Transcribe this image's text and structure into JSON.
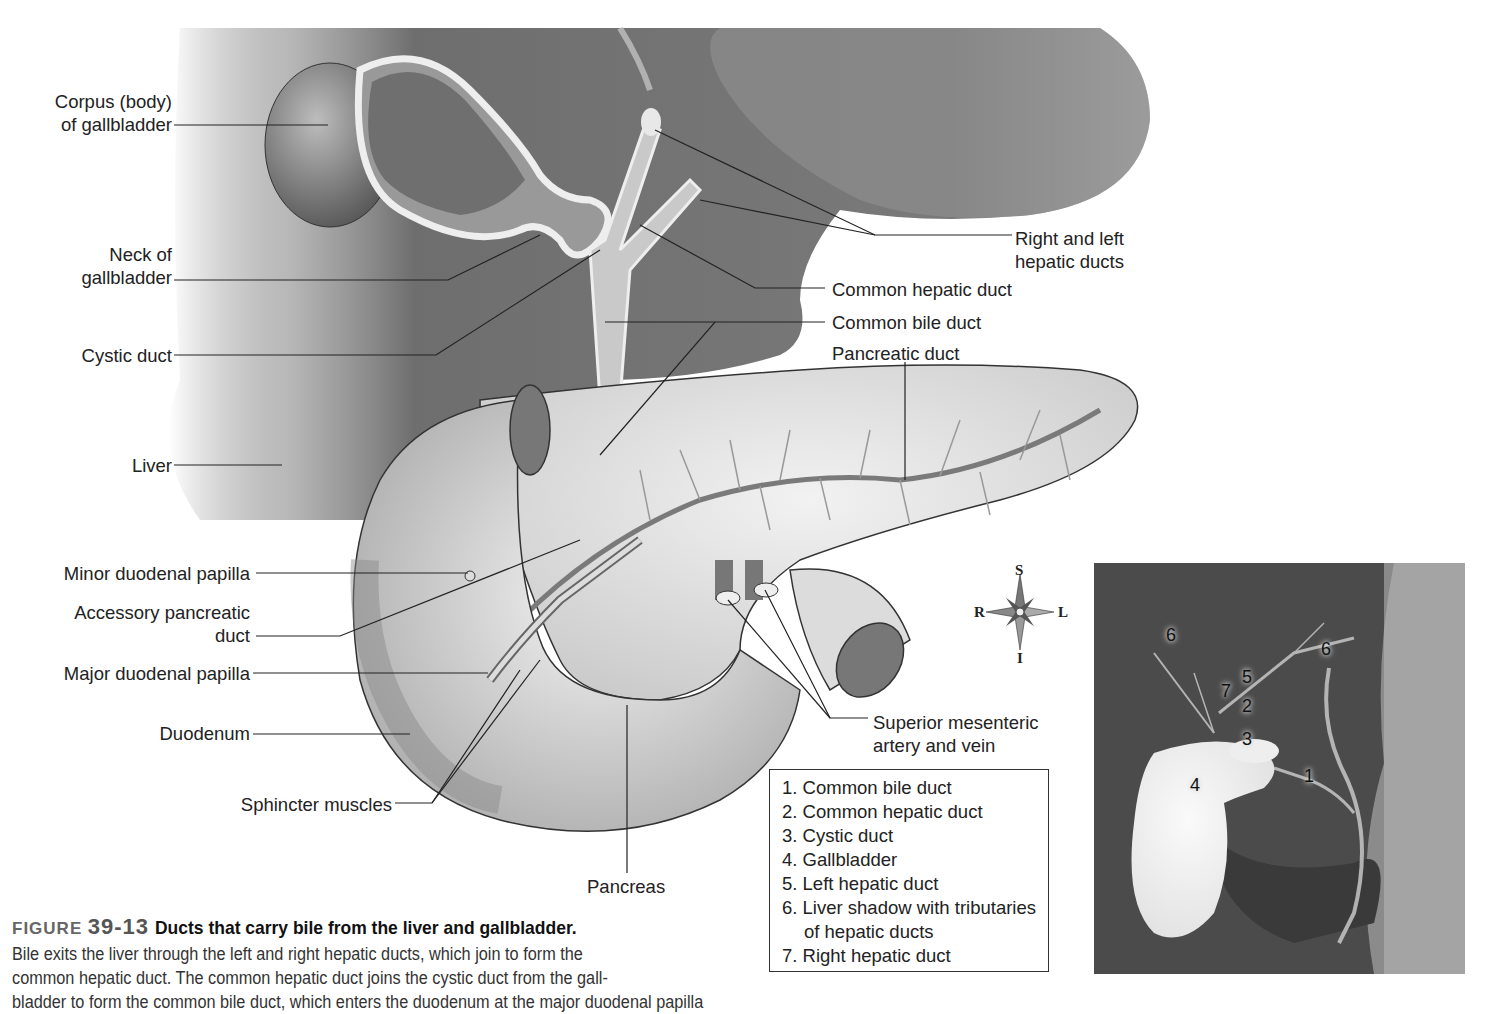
{
  "figure": {
    "number_prefix": "FIGURE",
    "number": "39-13",
    "title": "Ducts that carry bile from the liver and gallbladder.",
    "body_lines": [
      "Bile exits the liver through the left and right hepatic ducts, which join to form the",
      "common hepatic duct. The common hepatic duct joins the cystic duct from the gall-",
      "bladder to form the common bile duct, which enters the duodenum at the major duodenal papilla"
    ]
  },
  "labels_left": {
    "corpus_line1": "Corpus (body)",
    "corpus_line2": "of gallbladder",
    "neck_line1": "Neck of",
    "neck_line2": "gallbladder",
    "cystic": "Cystic duct",
    "liver": "Liver",
    "minor_papilla": "Minor duodenal papilla",
    "accessory_line1": "Accessory pancreatic",
    "accessory_line2": "duct",
    "major_papilla": "Major duodenal papilla",
    "duodenum": "Duodenum",
    "sphincter": "Sphincter muscles"
  },
  "labels_right": {
    "hepatic_line1": "Right and left",
    "hepatic_line2": "hepatic ducts",
    "common_hepatic": "Common hepatic duct",
    "common_bile": "Common bile duct",
    "pancreatic_duct": "Pancreatic duct",
    "sma_line1": "Superior mesenteric",
    "sma_line2": "artery and vein",
    "pancreas": "Pancreas"
  },
  "compass": {
    "top": "S",
    "bottom": "I",
    "left": "R",
    "right": "L"
  },
  "legend": {
    "items": [
      {
        "text": "1. Common bile duct"
      },
      {
        "text": "2. Common hepatic duct"
      },
      {
        "text": "3. Cystic duct"
      },
      {
        "text": "4. Gallbladder"
      },
      {
        "text": "5. Left hepatic duct"
      },
      {
        "text": "6. Liver shadow with tributaries",
        "sub": "of hepatic ducts"
      },
      {
        "text": "7. Right hepatic duct"
      }
    ]
  },
  "xray_markers": [
    "6",
    "6",
    "5",
    "7",
    "2",
    "3",
    "4",
    "1"
  ]
}
